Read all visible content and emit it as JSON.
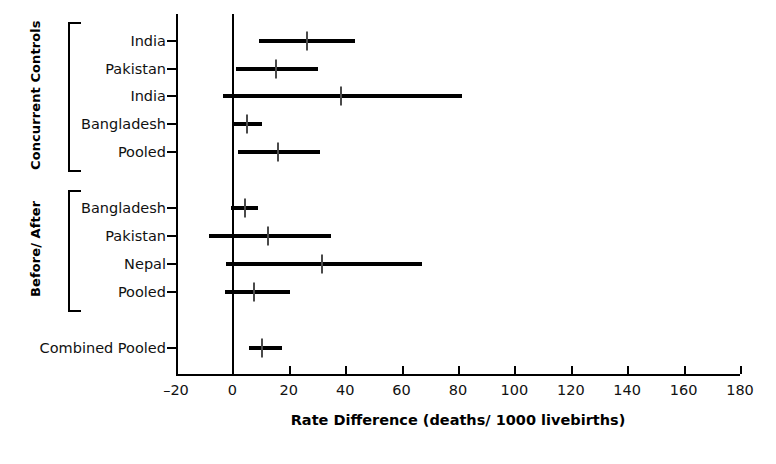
{
  "chart_data": {
    "type": "scatter",
    "subtype": "forest-plot",
    "title": "",
    "xlabel": "Rate Difference (deaths/ 1000 livebirths)",
    "ylabel": "",
    "xlim": [
      -20,
      180
    ],
    "xticks": [
      -20,
      0,
      20,
      40,
      60,
      80,
      100,
      120,
      140,
      160,
      180
    ],
    "xticklabels": [
      "–20",
      "0",
      "20",
      "40",
      "60",
      "80",
      "100",
      "120",
      "140",
      "160",
      "180"
    ],
    "grid": false,
    "legend": null,
    "reference_line": 0,
    "groups": [
      {
        "name": "Concurrent Controls",
        "rows": [
          {
            "label": "India",
            "value": 26.6,
            "ci_low": 9.5,
            "ci_high": 43.5
          },
          {
            "label": "Pakistan",
            "value": 15.6,
            "ci_low": 1.1,
            "ci_high": 30.5
          },
          {
            "label": "India",
            "value": 38.6,
            "ci_low": -3.5,
            "ci_high": 81.5
          },
          {
            "label": "Bangladesh",
            "value": 5.3,
            "ci_low": 0.4,
            "ci_high": 10.6
          },
          {
            "label": "Pooled",
            "value": 16.3,
            "ci_low": 2.1,
            "ci_high": 31.2
          }
        ]
      },
      {
        "name": "Before/ After",
        "rows": [
          {
            "label": "Bangladesh",
            "value": 4.6,
            "ci_low": -0.4,
            "ci_high": 9.2
          },
          {
            "label": "Pakistan",
            "value": 12.8,
            "ci_low": -8.2,
            "ci_high": 34.8
          },
          {
            "label": "Nepal",
            "value": 31.9,
            "ci_low": -2.1,
            "ci_high": 67.4
          },
          {
            "label": "Pooled",
            "value": 7.8,
            "ci_low": -2.5,
            "ci_high": 20.6
          }
        ]
      },
      {
        "name": "",
        "rows": [
          {
            "label": "Combined Pooled",
            "value": 10.6,
            "ci_low": 6.0,
            "ci_high": 17.7
          }
        ]
      }
    ]
  },
  "figure": {
    "background_color": "#ffffff",
    "mark_color": "#000000",
    "point_color": "#4a4a4a"
  }
}
